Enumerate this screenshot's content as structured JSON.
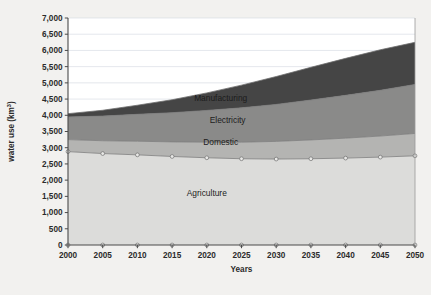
{
  "chart_data": {
    "type": "area",
    "stacked": true,
    "title": "",
    "xlabel": "Years",
    "ylabel": "water use (km3)",
    "ylabel_base": "water use (km",
    "ylabel_sup": "3",
    "ylabel_close": ")",
    "x": [
      2000,
      2005,
      2010,
      2015,
      2020,
      2025,
      2030,
      2035,
      2040,
      2045,
      2050
    ],
    "xtick_labels": [
      "2000",
      "2005",
      "2010",
      "2015",
      "2020",
      "2025",
      "2030",
      "2035",
      "2040",
      "2045",
      "2050"
    ],
    "ytick_labels": [
      "0",
      "500",
      "1,000",
      "1,500",
      "2,000",
      "2,500",
      "3,000",
      "3,500",
      "4,000",
      "4,500",
      "5,000",
      "5,500",
      "6,000",
      "6,500",
      "7,000"
    ],
    "ytick_values": [
      0,
      500,
      1000,
      1500,
      2000,
      2500,
      3000,
      3500,
      4000,
      4500,
      5000,
      5500,
      6000,
      6500,
      7000
    ],
    "ylim": [
      0,
      7000
    ],
    "xlim": [
      2000,
      2050
    ],
    "grid": true,
    "grid_axis": "y",
    "legend": "inline-labels",
    "series": [
      {
        "name": "Agriculture",
        "color": "#dcdcda",
        "values": [
          2880,
          2820,
          2780,
          2730,
          2690,
          2660,
          2650,
          2660,
          2680,
          2710,
          2750
        ],
        "label_x": 2020,
        "label_y": 1500
      },
      {
        "name": "Domestic",
        "color": "#b4b4b2",
        "values": [
          370,
          395,
          420,
          450,
          480,
          510,
          545,
          580,
          615,
          650,
          690
        ],
        "label_x": 2022,
        "label_y": 3080
      },
      {
        "name": "Electricity",
        "color": "#8a8a89",
        "values": [
          700,
          760,
          830,
          900,
          980,
          1060,
          1140,
          1230,
          1320,
          1410,
          1510
        ],
        "label_x": 2023,
        "label_y": 3750
      },
      {
        "name": "Manufacturing",
        "color": "#454545",
        "values": [
          100,
          180,
          280,
          400,
          540,
          700,
          860,
          1010,
          1140,
          1250,
          1300
        ],
        "label_x": 2022,
        "label_y": 4430
      }
    ],
    "totals": [
      4050,
      4155,
      4310,
      4480,
      4690,
      4930,
      5195,
      5480,
      5755,
      6020,
      6250
    ],
    "marker_series": [
      "Agriculture",
      "axis-baseline"
    ],
    "plot_area": {
      "left": 68,
      "right": 415,
      "top": 18,
      "bottom": 245
    }
  }
}
